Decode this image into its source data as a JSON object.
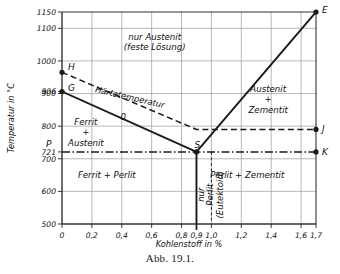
{
  "figure": {
    "caption": "Abb. 19.1."
  },
  "chart_data": {
    "type": "line",
    "title": "",
    "xlabel": "Kohlenstoff in %",
    "ylabel": "Temperatur in °C",
    "xlim": [
      0,
      1.7
    ],
    "ylim": [
      500,
      1150
    ],
    "grid": true,
    "legend_position": "none",
    "xticks": [
      0,
      0.2,
      0.4,
      0.6,
      0.8,
      0.9,
      1.0,
      1.2,
      1.4,
      1.6,
      1.7
    ],
    "xticklabels": [
      "0",
      "0,2",
      "0,4",
      "0,6",
      "0,8",
      "0,9",
      "1,0",
      "1,2",
      "1,4",
      "1,6",
      "1,7"
    ],
    "yticks": [
      500,
      600,
      700,
      721,
      800,
      900,
      906,
      1000,
      1100,
      1150
    ],
    "yticklabels": [
      "500",
      "600",
      "700",
      "721",
      "800",
      "900",
      "906",
      "1000",
      "1100",
      "1150"
    ],
    "gridlines_x": [
      0.2,
      0.4,
      0.6,
      0.8,
      1.0,
      1.2,
      1.4,
      1.6
    ],
    "gridlines_y": [
      600,
      700,
      800,
      900,
      1000,
      1100
    ],
    "points": [
      {
        "id": "H",
        "label": "H",
        "x": 0.0,
        "y": 965
      },
      {
        "id": "G",
        "label": "G",
        "x": 0.0,
        "y": 906
      },
      {
        "id": "P",
        "label": "P",
        "x": 0.0,
        "y": 721
      },
      {
        "id": "S",
        "label": "S",
        "x": 0.9,
        "y": 721
      },
      {
        "id": "E",
        "label": "E",
        "x": 1.7,
        "y": 1150
      },
      {
        "id": "J",
        "label": "J",
        "x": 1.7,
        "y": 790
      },
      {
        "id": "K",
        "label": "K",
        "x": 1.7,
        "y": 721
      }
    ],
    "series": [
      {
        "name": "GS (Ferrit/Austenit Grenze)",
        "style": "solid-thick",
        "points": [
          [
            0.0,
            906
          ],
          [
            0.9,
            721
          ]
        ]
      },
      {
        "name": "SE (Austenit/Zementit Grenze)",
        "style": "solid-thick",
        "points": [
          [
            0.9,
            721
          ],
          [
            1.7,
            1150
          ]
        ]
      },
      {
        "name": "Härtetemperatur",
        "style": "dashed",
        "points": [
          [
            0.0,
            965
          ],
          [
            0.9,
            790
          ],
          [
            1.7,
            790
          ]
        ]
      },
      {
        "name": "PSK (721 °C Linie)",
        "style": "dash-dot",
        "points": [
          [
            0.0,
            721
          ],
          [
            1.7,
            721
          ]
        ]
      },
      {
        "name": "Eutektoid-Senkrechte",
        "style": "solid-thick",
        "points": [
          [
            0.9,
            721
          ],
          [
            0.9,
            500
          ]
        ]
      },
      {
        "name": "Eutektoid-Hilfslinie",
        "style": "dashed-thin",
        "points": [
          [
            1.0,
            721
          ],
          [
            1.0,
            510
          ]
        ]
      }
    ],
    "annotations": [
      {
        "id": "nur-austenit",
        "text_lines": [
          "nur Austenit",
          "(feste Lösung)"
        ],
        "x": 0.62,
        "y": 1065
      },
      {
        "id": "austenit-zementit",
        "text_lines": [
          "Austenit",
          "+",
          "Zementit"
        ],
        "x": 1.38,
        "y": 905
      },
      {
        "id": "ferrit-austenit",
        "text_lines": [
          "Ferrit",
          "+",
          "Austenit"
        ],
        "x": 0.16,
        "y": 805
      },
      {
        "id": "ferrit-perlit",
        "text_lines": [
          "Ferrit + Perlit"
        ],
        "x": 0.3,
        "y": 640
      },
      {
        "id": "perlit-zementit",
        "text_lines": [
          "Perlit + Zementit"
        ],
        "x": 1.24,
        "y": 640
      },
      {
        "id": "nur-perlit-eutektoid",
        "text_lines": [
          "nur",
          "Perlit",
          "(Eutektoid)"
        ],
        "x": 0.95,
        "y": 590,
        "rotated": true
      },
      {
        "id": "haertetemperatur",
        "text_lines": [
          "Härtetemperatur"
        ],
        "x": 0.45,
        "y": 880,
        "rotated": true
      },
      {
        "id": "haerte-null",
        "text_lines": [
          "0"
        ],
        "x": 0.41,
        "y": 820
      }
    ],
    "colors": {
      "line": "#1a1a1a",
      "grid": "#9a9a9a",
      "axis": "#333333",
      "background": "#ffffff"
    }
  },
  "icons": {
    "data_point": "filled-circle-marker"
  }
}
